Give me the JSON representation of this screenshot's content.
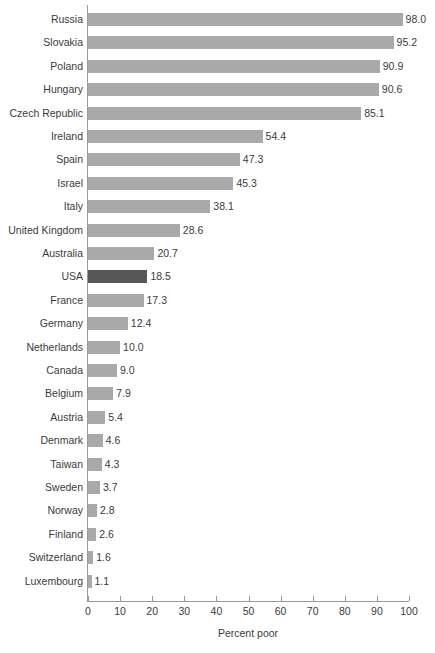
{
  "chart_data": {
    "type": "bar",
    "orientation": "horizontal",
    "title": "",
    "xlabel": "Percent poor",
    "ylabel": "",
    "xlim": [
      0,
      100
    ],
    "xticks": [
      0,
      10,
      20,
      30,
      40,
      50,
      60,
      70,
      80,
      90,
      100
    ],
    "grid": false,
    "legend": null,
    "bar_color": "#a9a9a9",
    "highlight_color": "#575757",
    "highlighted_category": "USA",
    "categories": [
      "Russia",
      "Slovakia",
      "Poland",
      "Hungary",
      "Czech Republic",
      "Ireland",
      "Spain",
      "Israel",
      "Italy",
      "United Kingdom",
      "Australia",
      "USA",
      "France",
      "Germany",
      "Netherlands",
      "Canada",
      "Belgium",
      "Austria",
      "Denmark",
      "Taiwan",
      "Sweden",
      "Norway",
      "Finland",
      "Switzerland",
      "Luxembourg"
    ],
    "values": [
      98.0,
      95.2,
      90.9,
      90.6,
      85.1,
      54.4,
      47.3,
      45.3,
      38.1,
      28.6,
      20.7,
      18.5,
      17.3,
      12.4,
      10.0,
      9.0,
      7.9,
      5.4,
      4.6,
      4.3,
      3.7,
      2.8,
      2.6,
      1.6,
      1.1
    ],
    "value_labels": [
      "98.0",
      "95.2",
      "90.9",
      "90.6",
      "85.1",
      "54.4",
      "47.3",
      "45.3",
      "38.1",
      "28.6",
      "20.7",
      "18.5",
      "17.3",
      "12.4",
      "10.0",
      "9.0",
      "7.9",
      "5.4",
      "4.6",
      "4.3",
      "3.7",
      "2.8",
      "2.6",
      "1.6",
      "1.1"
    ],
    "tick_labels": [
      "0",
      "10",
      "20",
      "30",
      "40",
      "50",
      "60",
      "70",
      "80",
      "90",
      "100"
    ]
  }
}
